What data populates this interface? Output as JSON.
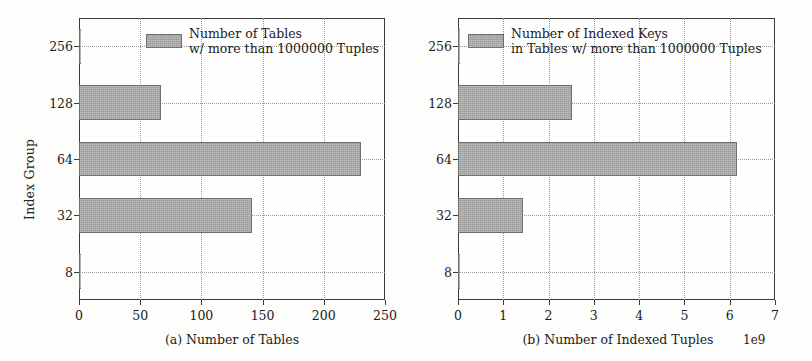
{
  "figure": {
    "background": "#fdfdfc",
    "bar_color": "#a8a8a8",
    "bar_edge_color": "#6e6e6e",
    "axis_color": "#3a3a3a",
    "grid_color": "#9a9a9a"
  },
  "chart_data": [
    {
      "type": "bar",
      "orientation": "horizontal",
      "panel": "a",
      "title": "",
      "caption": "(a) Number of Tables",
      "xlabel": "(a) Number of Tables",
      "ylabel": "Index Group",
      "categories": [
        "8",
        "32",
        "64",
        "128",
        "256"
      ],
      "values": [
        1.5,
        141,
        230,
        67,
        2
      ],
      "xlim": [
        0,
        250
      ],
      "ylim_categories": [
        "8",
        "32",
        "64",
        "128",
        "256"
      ],
      "xticks": [
        0,
        50,
        100,
        150,
        200,
        250
      ],
      "xticklabels": [
        "0",
        "50",
        "100",
        "150",
        "200",
        "250"
      ],
      "yticklabels": [
        "8",
        "32",
        "64",
        "128",
        "256"
      ],
      "grid": true,
      "grid_style": "dotted",
      "legend": {
        "position": "upper right",
        "entries": [
          {
            "line1": "Number of Tables",
            "line2": "w/ more than 1000000 Tuples",
            "color": "#a8a8a8"
          }
        ]
      },
      "exponent_label": ""
    },
    {
      "type": "bar",
      "orientation": "horizontal",
      "panel": "b",
      "title": "",
      "caption": "(b) Number of Indexed Tuples",
      "xlabel": "(b) Number of Indexed Tuples",
      "ylabel": "Index Group",
      "categories": [
        "8",
        "32",
        "64",
        "128",
        "256"
      ],
      "values": [
        0.02,
        1.43,
        6.17,
        2.51,
        0.03
      ],
      "value_scale": 1000000000,
      "xlim": [
        0,
        7
      ],
      "xticks": [
        0,
        1,
        2,
        3,
        4,
        5,
        6,
        7
      ],
      "xticklabels": [
        "0",
        "1",
        "2",
        "3",
        "4",
        "5",
        "6",
        "7"
      ],
      "yticklabels": [
        "8",
        "32",
        "64",
        "128",
        "256"
      ],
      "grid": true,
      "grid_style": "dotted",
      "legend": {
        "position": "upper right",
        "entries": [
          {
            "line1": "Number of Indexed Keys",
            "line2": "in Tables w/ more than 1000000 Tuples",
            "color": "#a8a8a8"
          }
        ]
      },
      "exponent_label": "1e9"
    }
  ]
}
